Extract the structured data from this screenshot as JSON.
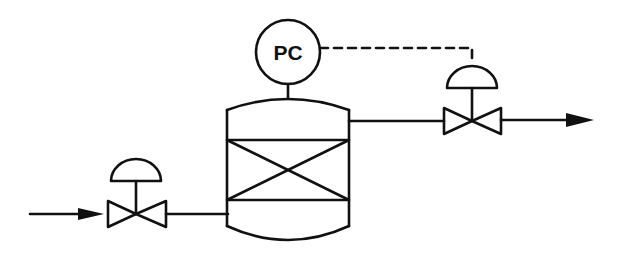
{
  "diagram": {
    "type": "process-flow-pressure-control",
    "controller": {
      "label": "PC",
      "meaning": "pressure controller"
    },
    "components": [
      {
        "id": "inlet-stream",
        "kind": "flow-arrow",
        "direction": "right"
      },
      {
        "id": "inlet-control-valve",
        "kind": "diaphragm-actuated control valve"
      },
      {
        "id": "packed-vessel",
        "kind": "vessel with packed bed (X section)"
      },
      {
        "id": "pressure-controller",
        "kind": "instrument bubble",
        "label": "PC"
      },
      {
        "id": "outlet-control-valve",
        "kind": "diaphragm-actuated control valve"
      },
      {
        "id": "outlet-stream",
        "kind": "flow-arrow",
        "direction": "right"
      }
    ],
    "connections": [
      {
        "from": "inlet-stream",
        "to": "inlet-control-valve",
        "style": "solid"
      },
      {
        "from": "inlet-control-valve",
        "to": "packed-vessel",
        "style": "solid"
      },
      {
        "from": "packed-vessel",
        "to": "pressure-controller",
        "style": "solid"
      },
      {
        "from": "pressure-controller",
        "to": "outlet-control-valve",
        "style": "dashed",
        "meaning": "signal"
      },
      {
        "from": "packed-vessel",
        "to": "outlet-control-valve",
        "style": "solid"
      },
      {
        "from": "outlet-control-valve",
        "to": "outlet-stream",
        "style": "solid"
      }
    ],
    "colors": {
      "line": "#111111",
      "background": "#ffffff"
    }
  }
}
